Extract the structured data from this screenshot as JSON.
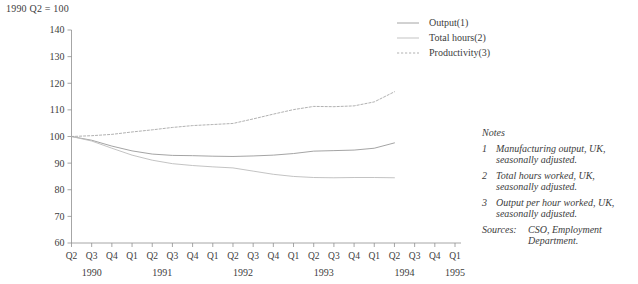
{
  "figure": {
    "index_caption": "1990 Q2 = 100"
  },
  "legend": {
    "items": [
      {
        "label": "Output(1)",
        "style": "solid",
        "color": "#9a9a9a"
      },
      {
        "label": "Total hours(2)",
        "style": "solid",
        "color": "#bcbcbc"
      },
      {
        "label": "Productivity(3)",
        "style": "dashed",
        "color": "#a8a8a8"
      }
    ]
  },
  "notes": {
    "title": "Notes",
    "items": [
      {
        "num": "1",
        "text": "Manufacturing output, UK, seasonally adjusted."
      },
      {
        "num": "2",
        "text": "Total hours worked, UK, seasonally adjusted."
      },
      {
        "num": "3",
        "text": "Output per hour worked, UK, seasonally adjusted."
      }
    ],
    "sources_label": "Sources:",
    "sources_text": "CSO, Employment Department."
  },
  "chart_data": {
    "type": "line",
    "title": "",
    "subtitle": "",
    "xlabel": "",
    "ylabel": "",
    "index_note": "1990 Q2 = 100",
    "grid": false,
    "legend_position": "top-right",
    "ylim": [
      60,
      140
    ],
    "yticks": [
      60,
      70,
      80,
      90,
      100,
      110,
      120,
      130,
      140
    ],
    "x": [
      "1990 Q2",
      "1990 Q3",
      "1990 Q4",
      "1991 Q1",
      "1991 Q2",
      "1991 Q3",
      "1991 Q4",
      "1992 Q1",
      "1992 Q2",
      "1992 Q3",
      "1992 Q4",
      "1993 Q1",
      "1993 Q2",
      "1993 Q3",
      "1993 Q4",
      "1994 Q1",
      "1994 Q2",
      "1994 Q3",
      "1994 Q4",
      "1995 Q1"
    ],
    "xtick_labels": [
      "Q2",
      "Q3",
      "Q4",
      "Q1",
      "Q2",
      "Q3",
      "Q4",
      "Q1",
      "Q2",
      "Q3",
      "Q4",
      "Q1",
      "Q2",
      "Q3",
      "Q4",
      "Q1",
      "Q2",
      "Q3",
      "Q4",
      "Q1"
    ],
    "xgroup_labels": [
      "1990",
      "1991",
      "1992",
      "1993",
      "1994",
      "1995"
    ],
    "series": [
      {
        "name": "Output(1)",
        "style": "solid",
        "color": "#9a9a9a",
        "values": [
          100.0,
          98.6,
          96.4,
          94.6,
          93.4,
          92.9,
          92.8,
          92.6,
          92.5,
          92.7,
          93.0,
          93.6,
          94.5,
          94.7,
          94.9,
          95.6,
          97.6,
          null,
          null,
          null
        ]
      },
      {
        "name": "Total hours(2)",
        "style": "solid",
        "color": "#bcbcbc",
        "values": [
          100.0,
          98.3,
          95.6,
          93.0,
          91.1,
          89.8,
          89.1,
          88.6,
          88.2,
          87.0,
          85.8,
          85.0,
          84.6,
          84.5,
          84.6,
          84.6,
          84.5,
          null,
          null,
          null
        ]
      },
      {
        "name": "Productivity(3)",
        "style": "dashed",
        "color": "#a8a8a8",
        "values": [
          100.0,
          100.3,
          100.8,
          101.7,
          102.5,
          103.4,
          104.1,
          104.5,
          104.9,
          106.6,
          108.4,
          110.1,
          111.3,
          111.2,
          111.5,
          113.0,
          116.8,
          null,
          null,
          null
        ]
      }
    ]
  }
}
